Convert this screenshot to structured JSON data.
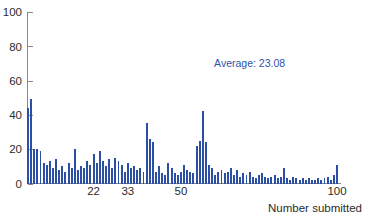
{
  "chart_data": {
    "type": "bar",
    "title": "",
    "subtitle": "",
    "xlabel": "Number submitted",
    "ylabel": "",
    "xlim": [
      0,
      101
    ],
    "ylim": [
      0,
      100
    ],
    "grid": false,
    "legend": null,
    "bar_color": "#2b4fa5",
    "annotation_color": "#2f53a8",
    "axis_color": "#8a8a8a",
    "y_ticks": [
      0,
      20,
      40,
      60,
      80,
      100
    ],
    "y_tick_labels": [
      "0",
      "20",
      "40",
      "60",
      "80",
      "100"
    ],
    "x_ticks": [
      22,
      33,
      50,
      100
    ],
    "x_tick_labels": [
      "22",
      "33",
      "50",
      "100"
    ],
    "annotations": [
      {
        "text": "Average: 23.08",
        "x": 72,
        "y": 68
      }
    ],
    "average": 23.08,
    "categories": [
      1,
      2,
      3,
      4,
      5,
      6,
      7,
      8,
      9,
      10,
      11,
      12,
      13,
      14,
      15,
      16,
      17,
      18,
      19,
      20,
      21,
      22,
      23,
      24,
      25,
      26,
      27,
      28,
      29,
      30,
      31,
      32,
      33,
      34,
      35,
      36,
      37,
      38,
      39,
      40,
      41,
      42,
      43,
      44,
      45,
      46,
      47,
      48,
      49,
      50,
      51,
      52,
      53,
      54,
      55,
      56,
      57,
      58,
      59,
      60,
      61,
      62,
      63,
      64,
      65,
      66,
      67,
      68,
      69,
      70,
      71,
      72,
      73,
      74,
      75,
      76,
      77,
      78,
      79,
      80,
      81,
      82,
      83,
      84,
      85,
      86,
      87,
      88,
      89,
      90,
      91,
      92,
      93,
      94,
      95,
      96,
      97,
      98,
      99,
      100
    ],
    "values": [
      44,
      49,
      20,
      20,
      19,
      12,
      11,
      13,
      9,
      14,
      8,
      10,
      7,
      12,
      9,
      20,
      8,
      10,
      9,
      13,
      11,
      17,
      12,
      19,
      13,
      10,
      14,
      9,
      15,
      13,
      11,
      7,
      12,
      9,
      10,
      8,
      9,
      7,
      35,
      26,
      24,
      7,
      10,
      6,
      5,
      12,
      9,
      6,
      5,
      7,
      11,
      8,
      7,
      6,
      22,
      25,
      42,
      24,
      11,
      9,
      5,
      7,
      8,
      6,
      7,
      9,
      5,
      8,
      4,
      6,
      5,
      7,
      4,
      3,
      5,
      6,
      4,
      3,
      4,
      5,
      3,
      4,
      9,
      3,
      2,
      4,
      3,
      2,
      3,
      2,
      3,
      2,
      2,
      3,
      2,
      3,
      4,
      2,
      5,
      11
    ]
  },
  "axis": {
    "x_title": "Number submitted"
  }
}
